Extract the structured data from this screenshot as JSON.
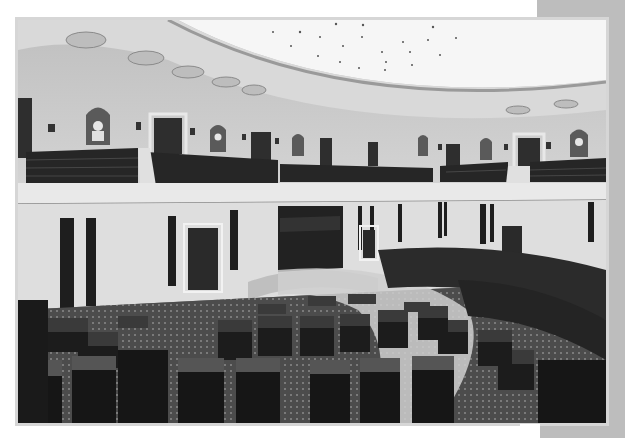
{
  "image": {
    "subject": "Legislative chamber interior",
    "description": "Black-and-white photograph of a semicircular legislative chamber with a coffered curved ceiling, upper-level visitor galleries with tiered seating, arched niches containing marble busts, wall sconces, paneled doors, and rows of wooden desks arranged in a semicircle on a patterned carpet around a central rostrum.",
    "color_mode": "grayscale",
    "colors": {
      "frame": "#d6d6d6",
      "side_panel": "#bdbdbd",
      "ceiling": "#f4f4f4",
      "walls": "#c8c8c8",
      "desks": "#2a2a2a",
      "carpet": "#4a4a4a"
    },
    "elements": {
      "ceiling": "curved dome with rosette medallions and ceiling lights",
      "galleries": "upper balconies with dark tiered seats",
      "niches": "arched alcoves with white busts",
      "doors": "dark paneled doorways on both levels",
      "desks": "rows of dark wooden desks in semicircular arrangement",
      "rostrum": "raised central dais at far wall"
    }
  }
}
